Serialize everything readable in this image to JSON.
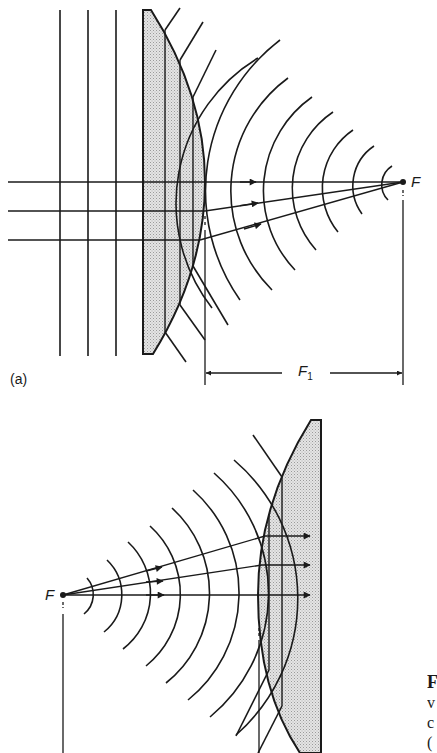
{
  "figure": {
    "panels": [
      {
        "id": "a",
        "label": "(a)",
        "description": "Plane waves refracted by a plano-convex lens converging to focal point F",
        "focus_label": "F",
        "dimension_label": "F",
        "dimension_subscript": "1",
        "incident_wavefront": "plane",
        "emergent_wavefront": "spherical-converging",
        "ray_count": 3
      },
      {
        "id": "b",
        "label": "",
        "description": "Spherical waves from focal point F collimated by a plano-convex lens",
        "focus_label": "F",
        "incident_wavefront": "spherical-diverging",
        "emergent_wavefront": "plane",
        "ray_count": 3
      }
    ],
    "caption_fragment": {
      "lines": [
        "F",
        "v",
        "c",
        "("
      ]
    }
  },
  "colors": {
    "ink": "#1a1a1a",
    "lens_fill": "#d6d6d6",
    "background": "#ffffff"
  }
}
